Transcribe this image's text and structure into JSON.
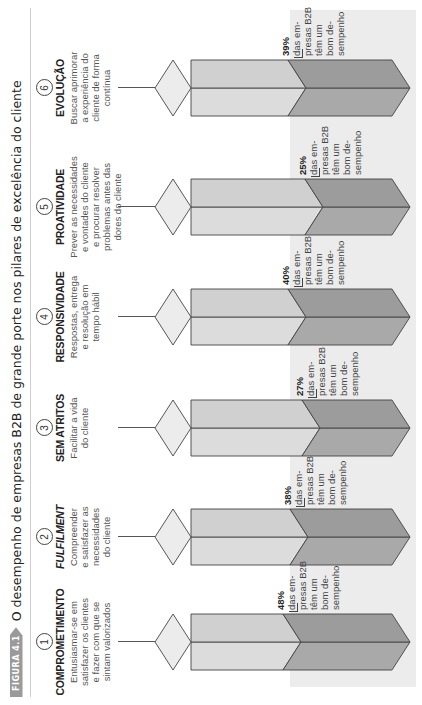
{
  "figure": {
    "badge": "FIGURA 4.1",
    "title": "O desempenho de empresas B2B de grande porte nos pilares de excelência do cliente"
  },
  "colors": {
    "light_face": "#dcdcdc",
    "light_face_lower": "#d0d0d0",
    "dark_face": "#a9a9a9",
    "dark_face_lower": "#9c9c9c",
    "cap": "#ececec",
    "band": "#ececec",
    "outline": "#444444"
  },
  "pillars": [
    {
      "number": "1",
      "title": "COMPROMETIMENTO",
      "italic": false,
      "desc": [
        "Entusiasmar-se em",
        "satisfazer os clientes",
        "e fazer com que se",
        "sintam valorizados"
      ],
      "pct": "48%",
      "caption": [
        "das em-",
        "presas B2B",
        "têm um",
        "bom de-",
        "sempenho"
      ]
    },
    {
      "number": "2",
      "title": "FULFILMENT",
      "italic": true,
      "desc": [
        "Compreender",
        "e satisfazer as",
        "necessidades",
        "do cliente"
      ],
      "pct": "38%",
      "caption": [
        "das em-",
        "presas B2B",
        "têm um",
        "bom de-",
        "sempenho"
      ]
    },
    {
      "number": "3",
      "title": "SEM ATRITOS",
      "italic": false,
      "desc": [
        "Facilitar a vida",
        "do cliente"
      ],
      "pct": "27%",
      "caption": [
        "das em-",
        "presas B2B",
        "têm um",
        "bom de-",
        "sempenho"
      ]
    },
    {
      "number": "4",
      "title": "RESPONSIVIDADE",
      "italic": false,
      "desc": [
        "Respostas, entrega",
        "e resolução em",
        "tempo hábil"
      ],
      "pct": "40%",
      "caption": [
        "das em-",
        "presas B2B",
        "têm um",
        "bom de-",
        "sempenho"
      ]
    },
    {
      "number": "5",
      "title": "PROATIVIDADE",
      "italic": false,
      "desc": [
        "Prever as necessidades",
        "e vontades do cliente",
        "e procurar resolver",
        "problemas antes das",
        "dores do cliente"
      ],
      "pct": "25%",
      "caption": [
        "das em-",
        "presas B2B",
        "têm um",
        "bom de-",
        "sempenho"
      ]
    },
    {
      "number": "6",
      "title": "EVOLUÇÃO",
      "italic": false,
      "desc": [
        "Buscar aprimorar",
        "a experiência do",
        "cliente de forma",
        "contínua"
      ],
      "pct": "39%",
      "caption": [
        "das em-",
        "presas B2B",
        "têm um",
        "bom de-",
        "sempenho"
      ]
    }
  ],
  "chart_data": {
    "type": "bar",
    "title": "O desempenho de empresas B2B de grande porte nos pilares de excelência do cliente",
    "categories": [
      "Comprometimento",
      "Fulfilment",
      "Sem atritos",
      "Responsividade",
      "Proatividade",
      "Evolução"
    ],
    "values": [
      48,
      38,
      27,
      40,
      25,
      39
    ],
    "unit": "%",
    "ylabel": "% das empresas B2B que têm um bom desempenho",
    "xlabel": "",
    "ylim": [
      0,
      100
    ],
    "grid": false,
    "legend": "none",
    "orientation": "vertical 3D prisms (page rotated 90°)"
  }
}
